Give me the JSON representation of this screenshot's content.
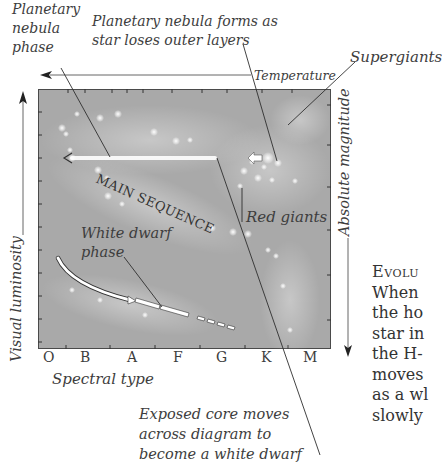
{
  "diagram": {
    "title_region": "Hertzsprung-Russell diagram showing stellar evolution",
    "plot_background": "#a9a9a9",
    "labels": {
      "planetary_nebula_phase": [
        "Planetary",
        "nebula",
        "phase"
      ],
      "planetary_nebula_forms": [
        "Planetary nebula forms as",
        "star loses outer layers"
      ],
      "temperature": "Temperature",
      "supergiants": "Supergiants",
      "absolute_magnitude": "Absolute magnitude",
      "visual_luminosity": "Visual luminosity",
      "main_sequence": "MAIN SEQUENCE",
      "red_giants": "Red giants",
      "white_dwarf_phase": [
        "White dwarf",
        "phase"
      ],
      "spectral_type": "Spectral type",
      "exposed_core": [
        "Exposed core moves",
        "across diagram to",
        "become a white dwarf"
      ]
    },
    "spectral_classes": [
      "O",
      "B",
      "A",
      "F",
      "G",
      "K",
      "M"
    ]
  },
  "body_text": {
    "heading": "Evolu",
    "lines": [
      "When",
      "the ho",
      "star in",
      "the H-",
      "moves",
      "as a wl",
      "slowly"
    ]
  }
}
